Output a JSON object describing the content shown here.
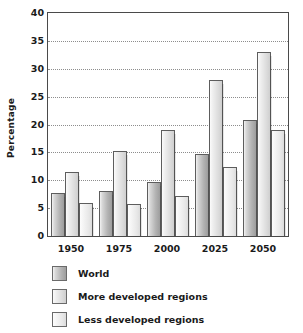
{
  "chart_data": {
    "type": "bar",
    "title": "",
    "xlabel": "",
    "ylabel": "Percentage",
    "categories": [
      "1950",
      "1975",
      "2000",
      "2025",
      "2050"
    ],
    "series": [
      {
        "name": "World",
        "values": [
          7.8,
          8.0,
          9.7,
          14.8,
          20.8
        ]
      },
      {
        "name": "More developed regions",
        "values": [
          11.4,
          15.2,
          19.0,
          28.0,
          33.0
        ]
      },
      {
        "name": "Less developed regions",
        "values": [
          5.9,
          5.7,
          7.2,
          12.3,
          19.0
        ]
      }
    ],
    "ylim": [
      0,
      40
    ],
    "yticks": [
      0,
      5,
      10,
      15,
      20,
      25,
      30,
      35,
      40
    ],
    "ytick_labels": [
      "0",
      "5",
      "10",
      "15",
      "20",
      "25",
      "30",
      "35",
      "40"
    ],
    "grid": true,
    "grid_axis": "y",
    "grid_style": "dotted",
    "legend_position": "below",
    "legend": [
      "World",
      "More developed regions",
      "Less developed regions"
    ],
    "colors": [
      "#b4b4b4",
      "#dcdcdc",
      "#ececec"
    ],
    "axis_color": "#4a4a4a",
    "grid_color": "#8d8d8d"
  }
}
